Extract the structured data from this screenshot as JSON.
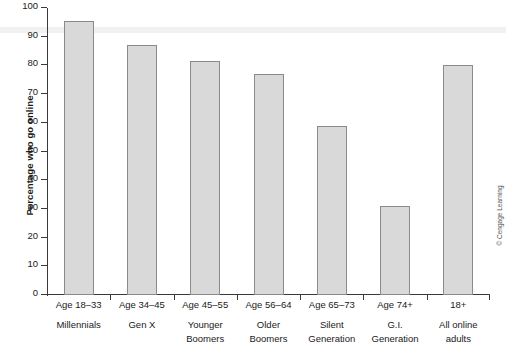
{
  "chart_data": {
    "type": "bar",
    "title": "",
    "xlabel": "",
    "ylabel": "Percentage who go online",
    "ylim": [
      0,
      100
    ],
    "yticks": [
      0,
      10,
      20,
      30,
      40,
      50,
      60,
      70,
      80,
      90,
      100
    ],
    "grid": false,
    "legend": null,
    "categories": [
      "Age 18–33",
      "Age 34–45",
      "Age 45–55",
      "Age 56–64",
      "Age 65–73",
      "Age 74+",
      "18+"
    ],
    "category_sublabels": [
      "Millennials",
      "Gen X",
      "Younger Boomers",
      "Older Boomers",
      "Silent Generation",
      "G.I. Generation",
      "All online adults"
    ],
    "values": [
      95.5,
      87,
      81.5,
      77,
      59,
      31,
      80
    ],
    "bar_fill_color": "#d9d9d9",
    "bar_edge_color": "#8a8a8a",
    "axis_color": "#3a3a3a"
  },
  "axis": {
    "y_title": "Percentage who go online",
    "tick_labels": [
      "100",
      "90",
      "80",
      "70",
      "60",
      "50",
      "40",
      "30",
      "20",
      "10",
      "0"
    ]
  },
  "categories": [
    {
      "line1": "Age 18–33",
      "line2": "Millennials",
      "line3": ""
    },
    {
      "line1": "Age 34–45",
      "line2": "Gen X",
      "line3": ""
    },
    {
      "line1": "Age 45–55",
      "line2": "Younger",
      "line3": "Boomers"
    },
    {
      "line1": "Age 56–64",
      "line2": "Older",
      "line3": "Boomers"
    },
    {
      "line1": "Age 65–73",
      "line2": "Silent",
      "line3": "Generation"
    },
    {
      "line1": "Age 74+",
      "line2": "G.I.",
      "line3": "Generation"
    },
    {
      "line1": "18+",
      "line2": "All online",
      "line3": "adults"
    }
  ],
  "credit": {
    "text": "© Cengage Learning"
  }
}
